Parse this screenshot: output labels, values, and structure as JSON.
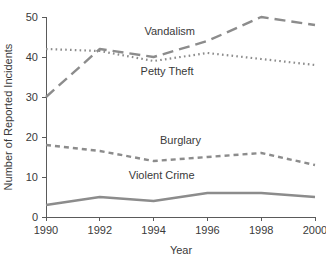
{
  "chart_data": {
    "type": "line",
    "title": "",
    "xlabel": "Year",
    "ylabel": "Number of Reported Incidents",
    "x": [
      1990,
      1992,
      1994,
      1996,
      1998,
      2000
    ],
    "categories": [
      "1990",
      "1992",
      "1994",
      "1996",
      "1998",
      "2000"
    ],
    "xlim": [
      1990,
      2000
    ],
    "ylim": [
      0,
      50
    ],
    "yticks": [
      0,
      10,
      20,
      30,
      40,
      50
    ],
    "yticklabels": [
      "0",
      "10",
      "20",
      "30",
      "40",
      "50"
    ],
    "xticks": [
      1990,
      1992,
      1994,
      1996,
      1998,
      2000
    ],
    "xticklabels": [
      "1990",
      "1992",
      "1994",
      "1996",
      "1998",
      "2000"
    ],
    "grid": false,
    "legend": "inline-labels",
    "series": [
      {
        "name": "Vandalism",
        "values": [
          30,
          42,
          40,
          44,
          50,
          48
        ],
        "dash": "long-dash",
        "color": "#8c8c8c"
      },
      {
        "name": "Petty Theft",
        "values": [
          42,
          41.5,
          39,
          41,
          39.5,
          38
        ],
        "dash": "dotted",
        "color": "#8c8c8c"
      },
      {
        "name": "Burglary",
        "values": [
          18,
          16.5,
          14,
          15,
          16,
          13
        ],
        "dash": "short-dash",
        "color": "#8c8c8c"
      },
      {
        "name": "Violent Crime",
        "values": [
          3,
          5,
          4,
          6,
          6,
          5
        ],
        "dash": "solid",
        "color": "#8c8c8c"
      }
    ],
    "annotations": [
      {
        "text": "Vandalism",
        "x": 1994.6,
        "y": 45.4
      },
      {
        "text": "Petty Theft",
        "x": 1994.5,
        "y": 35.6
      },
      {
        "text": "Burglary",
        "x": 1995.0,
        "y": 18.2
      },
      {
        "text": "Violent Crime",
        "x": 1994.3,
        "y": 9.4
      }
    ]
  },
  "axes": {
    "y_label": "Number of Reported Incidents",
    "x_label": "Year"
  },
  "colors": {
    "line": "#8c8c8c",
    "axis": "#5a5a5a",
    "text": "#3a3a3a",
    "background": "#ffffff"
  }
}
